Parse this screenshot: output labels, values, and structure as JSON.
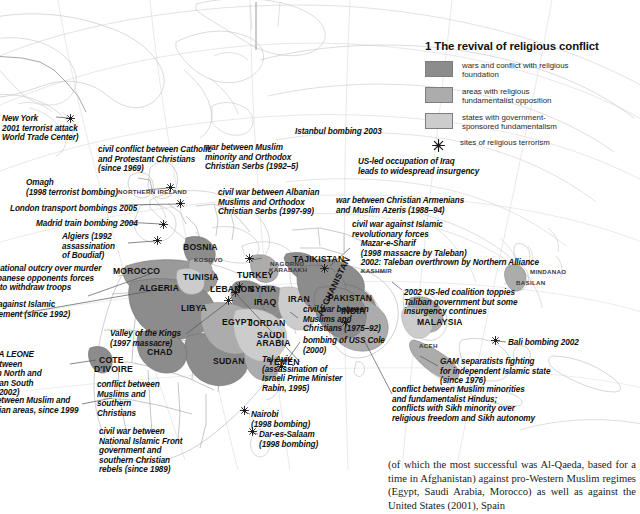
{
  "legend": {
    "title": "1 The revival of religious conflict",
    "items": [
      {
        "swatch": "#8c8c8c",
        "label": "wars and conflict with religious\nfoundation",
        "icon": "filled-square"
      },
      {
        "swatch": "#acacac",
        "label": "areas with religious\nfundamentalist opposition",
        "icon": "filled-square"
      },
      {
        "swatch": "#cccccc",
        "label": "states with government-\nsponsored fundamentalism",
        "icon": "filled-square"
      },
      {
        "swatch": "",
        "label": "sites of religious terrorism",
        "icon": "star-burst"
      }
    ]
  },
  "colors": {
    "conflict_dark": "#8c8c8c",
    "fundamentalist_opposition": "#acacac",
    "government_sponsored": "#cccccc",
    "coastline": "#b9b9b9",
    "border": "#8e8e8e",
    "text": "#111111"
  },
  "annotations": [
    {
      "id": "new-york",
      "text": "New York\n2001 terrorist attack\nWorld Trade Center)",
      "x": 2,
      "y": 114
    },
    {
      "id": "northern-ireland-conflict",
      "text": "civil conflict between Catholic\nand Protestant Christians\n(since 1969)",
      "x": 98,
      "y": 145
    },
    {
      "id": "omagh",
      "text": "Omagh\n(1998 terrorist bombing)",
      "x": 26,
      "y": 178
    },
    {
      "id": "london-bombings",
      "text": "London transport bombings 2005",
      "x": 10,
      "y": 204
    },
    {
      "id": "madrid-bombing",
      "text": "Madrid train bombing 2004",
      "x": 36,
      "y": 219
    },
    {
      "id": "algiers",
      "text": "Algiers (1992\nassassination\nof Boudiaf)",
      "x": 62,
      "y": 232
    },
    {
      "id": "lebanon-outcry",
      "text": "international outcry over murder\nof Lebanese opponents forces\nSyria to withdraw troops",
      "x": -22,
      "y": 264
    },
    {
      "id": "war-against-islamic",
      "text": "war against Islamic\nmovement (since 1992)",
      "x": -18,
      "y": 300
    },
    {
      "id": "sierra-leone",
      "text": "SIERRA LEONE\nwar between\nMuslim North and\nChristian South\n(1991–2002)",
      "x": -26,
      "y": 350
    },
    {
      "id": "nigeria-war",
      "text": "war between Muslim and\nChristian areas, since 1999",
      "x": -24,
      "y": 396
    },
    {
      "id": "bosnia-conflict",
      "text": "war between Muslim\nminority and Orthodox\nChristian Serbs (1992–5)",
      "x": 205,
      "y": 143
    },
    {
      "id": "istanbul-bombing",
      "text": "Istanbul bombing 2003",
      "x": 295,
      "y": 127
    },
    {
      "id": "kosovo-conflict",
      "text": "civil war between Albanian\nMuslims and Orthodox\nChristian Serbs (1997-99)",
      "x": 218,
      "y": 188
    },
    {
      "id": "iraq-occupation",
      "text": "US-led occupation of Iraq\nleads to widespread insurgency",
      "x": 358,
      "y": 157
    },
    {
      "id": "armenia-azerbaijan",
      "text": "war between Christian Armenians\nand Muslim Azeris (1988–94)",
      "x": 336,
      "y": 196
    },
    {
      "id": "afghanistan-civil-war",
      "text": "civil war against Islamic\nrevolutionary forces\n    Mazar-e-Sharif\n    (1998 massacre by Taleban)\n    2002: Taleban overthrown by Northern Alliance",
      "x": 352,
      "y": 220
    },
    {
      "id": "afghanistan-2002",
      "text": "2002 US-led coalition toppies\nTaliban government but some\ninsurgency continues",
      "x": 404,
      "y": 288
    },
    {
      "id": "valley-of-kings",
      "text": "Valley of the Kings\n(1997 massacre)",
      "x": 110,
      "y": 329
    },
    {
      "id": "lebanon-civil-war",
      "text": "civil war between\nMuslims and\nChristians (1975–92)",
      "x": 303,
      "y": 305
    },
    {
      "id": "uss-cole",
      "text": "bombing of USS Cole\n(2000)",
      "x": 303,
      "y": 336
    },
    {
      "id": "tel-aviv",
      "text": "Tel Aviv\n(assassination of\nIsraeli Prime Minister\nRabin, 1995)",
      "x": 262,
      "y": 355
    },
    {
      "id": "nairobi",
      "text": "Nairobi\n(1998 bombing)",
      "x": 251,
      "y": 410
    },
    {
      "id": "dar-es-salaam",
      "text": "Dar-es-Salaam\n(1998 bombing)",
      "x": 259,
      "y": 430
    },
    {
      "id": "cote-divoire-conflict",
      "text": "conflict between\nMuslims and\nsouthern\nChristians",
      "x": 97,
      "y": 380
    },
    {
      "id": "sudan-civil-war",
      "text": "civil war between\nNational Islamic Front\ngovernment and\nsouthern Christian\nrebels (since 1989)",
      "x": 99,
      "y": 427
    },
    {
      "id": "bali-bombing",
      "text": "Bali bombing 2002",
      "x": 508,
      "y": 338
    },
    {
      "id": "gam-separatists",
      "text": "GAM separatists fighting\nfor independent Islamic state\n(since 1976)",
      "x": 440,
      "y": 357
    },
    {
      "id": "india-conflicts",
      "text": "conflict between Muslim minorities\nand fundamentalist Hindus;\nconflicts with Sikh minority over\nreligious freedom and Sikh autonomy",
      "x": 392,
      "y": 385
    }
  ],
  "places": [
    {
      "name": "NORTHERN IRELAND",
      "x": 118,
      "y": 188,
      "size": "sm"
    },
    {
      "name": "BOSNIA",
      "x": 183,
      "y": 242,
      "size": "lg"
    },
    {
      "name": "KOSOVO",
      "x": 194,
      "y": 256,
      "size": "sm"
    },
    {
      "name": "MOROCCO",
      "x": 113,
      "y": 266,
      "size": "lg"
    },
    {
      "name": "ALGERIA",
      "x": 139,
      "y": 283,
      "size": "lg"
    },
    {
      "name": "TUNISIA",
      "x": 183,
      "y": 272,
      "size": "lg"
    },
    {
      "name": "LIBYA",
      "x": 181,
      "y": 303,
      "size": "lg"
    },
    {
      "name": "LEBANON",
      "x": 210,
      "y": 284,
      "size": "lg"
    },
    {
      "name": "SYRIA",
      "x": 249,
      "y": 284,
      "size": "lg"
    },
    {
      "name": "IRAQ",
      "x": 254,
      "y": 297,
      "size": "lg"
    },
    {
      "name": "TURKEY",
      "x": 237,
      "y": 270,
      "size": "lg"
    },
    {
      "name": "IRAN",
      "x": 288,
      "y": 294,
      "size": "lg"
    },
    {
      "name": "EGYPT",
      "x": 222,
      "y": 317,
      "size": "lg"
    },
    {
      "name": "JORDAN",
      "x": 248,
      "y": 318,
      "size": "lg"
    },
    {
      "name": "SAUDI",
      "x": 257,
      "y": 330,
      "size": "lg"
    },
    {
      "name": "ARABIA",
      "x": 256,
      "y": 338,
      "size": "lg"
    },
    {
      "name": "YEMEN",
      "x": 268,
      "y": 357,
      "size": "lg"
    },
    {
      "name": "CHAD",
      "x": 147,
      "y": 347,
      "size": "lg"
    },
    {
      "name": "SUDAN",
      "x": 213,
      "y": 356,
      "size": "lg"
    },
    {
      "name": "COTE",
      "x": 99,
      "y": 355,
      "size": "lg"
    },
    {
      "name": "D'IVOIRE",
      "x": 94,
      "y": 364,
      "size": "lg"
    },
    {
      "name": "TAJIKISTAN",
      "x": 293,
      "y": 254,
      "size": "lg"
    },
    {
      "name": "NAGORNO",
      "x": 270,
      "y": 260,
      "size": "sm"
    },
    {
      "name": "KARABAKH",
      "x": 269,
      "y": 266,
      "size": "sm"
    },
    {
      "name": "PAKISTAN",
      "x": 328,
      "y": 293,
      "size": "lg"
    },
    {
      "name": "INDIA",
      "x": 341,
      "y": 306,
      "size": "lg"
    },
    {
      "name": "KASHMIR",
      "x": 361,
      "y": 267,
      "size": "sm"
    },
    {
      "name": "MALAYSIA",
      "x": 417,
      "y": 317,
      "size": "lg"
    },
    {
      "name": "MINDANAO",
      "x": 530,
      "y": 268,
      "size": "sm"
    },
    {
      "name": "BASILAN",
      "x": 516,
      "y": 279,
      "size": "sm"
    },
    {
      "name": "ACEH",
      "x": 419,
      "y": 342,
      "size": "sm"
    }
  ],
  "rotated_places": [
    {
      "name": "AFGHANISTAN",
      "x": 315,
      "y": 313
    }
  ],
  "stars": [
    {
      "id": "star-new-york",
      "x": 70,
      "y": 118
    },
    {
      "id": "star-northern-ireland",
      "x": 170,
      "y": 187
    },
    {
      "id": "star-london",
      "x": 180,
      "y": 203
    },
    {
      "id": "star-madrid",
      "x": 163,
      "y": 224
    },
    {
      "id": "star-algiers",
      "x": 157,
      "y": 240
    },
    {
      "id": "star-istanbul",
      "x": 249,
      "y": 258
    },
    {
      "id": "star-luxor",
      "x": 228,
      "y": 300
    },
    {
      "id": "star-beirut",
      "x": 239,
      "y": 286
    },
    {
      "id": "star-tel-aviv",
      "x": 235,
      "y": 292
    },
    {
      "id": "star-aden",
      "x": 281,
      "y": 366
    },
    {
      "id": "star-nairobi",
      "x": 244,
      "y": 410
    },
    {
      "id": "star-dar-es-salaam",
      "x": 252,
      "y": 431
    },
    {
      "id": "star-bali",
      "x": 495,
      "y": 340
    },
    {
      "id": "star-mazar",
      "x": 324,
      "y": 268
    },
    {
      "id": "star-bombay",
      "x": 345,
      "y": 322
    }
  ],
  "body_text": "(of which the most successful was Al-Qaeda, based for a time in Afghanistan) against pro-Western Muslim regimes (Egypt, Saudi Arabia, Morocco) as well as against the United States (2001), Spain"
}
